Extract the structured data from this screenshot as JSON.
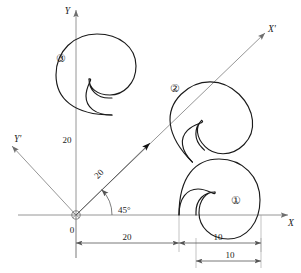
{
  "figure": {
    "axes": {
      "x_label": "X",
      "y_label": "Y",
      "x_prime_label": "X'",
      "y_prime_label": "Y'",
      "origin_label": "0",
      "angle_label": "45°"
    },
    "shape_markers": [
      {
        "id": "marker-1",
        "label": "①"
      },
      {
        "id": "marker-2",
        "label": "②"
      },
      {
        "id": "marker-3",
        "label": "③"
      }
    ],
    "dimensions": [
      {
        "id": "dim-x-20",
        "label": "20"
      },
      {
        "id": "dim-x-10",
        "label": "10"
      },
      {
        "id": "dim-x-10-low",
        "label": "10"
      },
      {
        "id": "dim-diagonal",
        "label": "20"
      },
      {
        "id": "dim-y-20",
        "label": "20"
      }
    ],
    "colors": {
      "curve": "#1a1a1a",
      "axis": "#8a8a8a",
      "dimension": "#6e6e6e",
      "background": "#ffffff"
    }
  }
}
